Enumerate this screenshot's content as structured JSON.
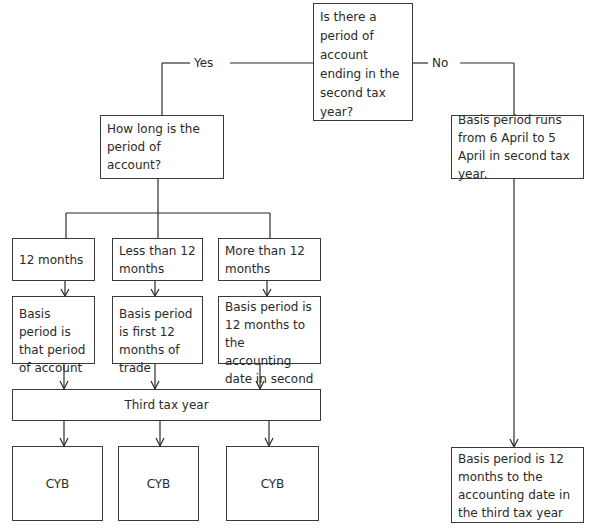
{
  "flowchart": {
    "root_question": "Is there a period of account ending in the second tax year?",
    "branch_yes_label": "Yes",
    "branch_no_label": "No",
    "yes": {
      "question": "How long is the period of account?",
      "options": [
        {
          "label": "12 months",
          "basis": "Basis period is that period of account",
          "outcome": "CYB"
        },
        {
          "label": "Less than 12 months",
          "basis": "Basis period is first 12 months of trade",
          "outcome": "CYB"
        },
        {
          "label": "More than 12 months",
          "basis": "Basis period is 12 months to the accounting date in second tax year",
          "outcome": "CYB"
        }
      ],
      "merge_label": "Third tax year"
    },
    "no": {
      "basis_second_year": "Basis period runs from 6 April to 5 April in second tax year.",
      "basis_third_year": "Basis period is 12 months to the accounting date in the third tax year"
    }
  }
}
